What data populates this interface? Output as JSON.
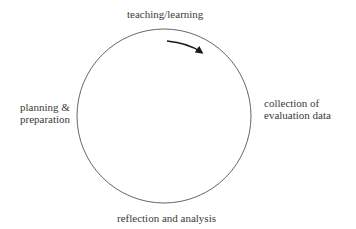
{
  "diagram": {
    "type": "cycle",
    "direction": "clockwise",
    "nodes": [
      {
        "position": "top",
        "lines": [
          "teaching/learning"
        ]
      },
      {
        "position": "right",
        "lines": [
          "collection of",
          "evaluation data"
        ]
      },
      {
        "position": "bottom",
        "lines": [
          "reflection and analysis"
        ]
      },
      {
        "position": "left",
        "lines": [
          "planning &",
          "preparation"
        ]
      }
    ],
    "arrow": {
      "icon": "curved-arrow-clockwise",
      "location": "top-right inside circle"
    },
    "colors": {
      "stroke": "#555555",
      "arrow": "#1a1a1a",
      "text": "#3a3a3a",
      "background": "#ffffff"
    }
  }
}
